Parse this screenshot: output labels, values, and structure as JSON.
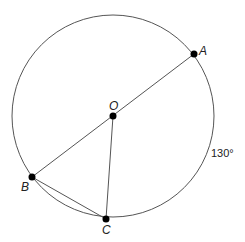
{
  "diagram": {
    "type": "circle-geometry",
    "circle": {
      "center_label": "O",
      "cx": 113,
      "cy": 116,
      "r": 101
    },
    "points": [
      {
        "id": "A",
        "label": "A",
        "x": 194,
        "y": 54
      },
      {
        "id": "O",
        "label": "O",
        "x": 113,
        "y": 116
      },
      {
        "id": "B",
        "label": "B",
        "x": 32,
        "y": 177
      },
      {
        "id": "C",
        "label": "C",
        "x": 106,
        "y": 219
      }
    ],
    "segments": [
      {
        "from": "A",
        "to": "B",
        "note": "diameter through O"
      },
      {
        "from": "O",
        "to": "C"
      },
      {
        "from": "B",
        "to": "C"
      }
    ],
    "arc_label": {
      "text": "130°",
      "arc": "AC"
    },
    "colors": {
      "stroke": "#555555",
      "point": "#000000",
      "text": "#222222"
    }
  }
}
